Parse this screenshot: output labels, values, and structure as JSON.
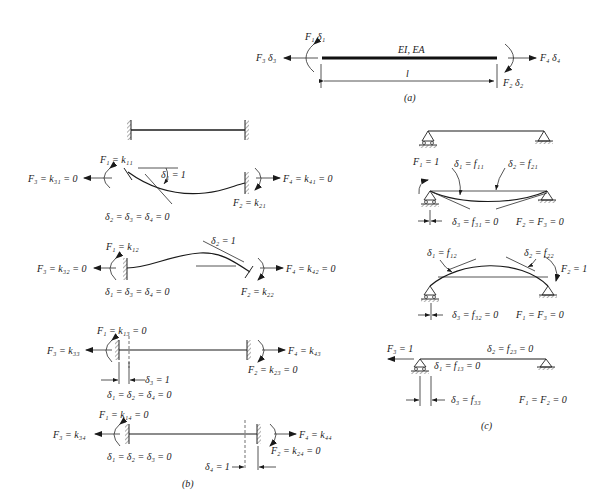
{
  "part_a": {
    "caption": "(a)",
    "beam_props": "EI, EA",
    "length": "l",
    "left_top": "F₁ δ₁",
    "left_side": "F₃ δ₃",
    "right_side": "F₄ δ₄",
    "right_bottom": "F₂ δ₂"
  },
  "part_b": {
    "caption": "(b)",
    "case1": {
      "f1": "F₁ = k₁₁",
      "f3": "F₃ = k₃₁ = 0",
      "f4": "F₄ = k₄₁ = 0",
      "f2": "F₂ = k₂₁",
      "disp": "δ₁ = 1",
      "zeros": "δ₂ = δ₃ = δ₄ = 0"
    },
    "case2": {
      "f1": "F₁ = k₁₂",
      "f3": "F₃ = k₃₂ = 0",
      "f4": "F₄ = k₄₂ = 0",
      "f2": "F₂ = k₂₂",
      "disp": "δ₂ = 1",
      "zeros": "δ₁ = δ₃ = δ₄ = 0"
    },
    "case3": {
      "f1": "F₁ = k₁₃ = 0",
      "f3": "F₃ = k₃₃",
      "f4": "F₄ = k₄₃",
      "f2": "F₂ = k₂₃ = 0",
      "disp": "δ₃ = 1",
      "zeros": "δ₁ = δ₂ = δ₄ = 0"
    },
    "case4": {
      "f1": "F₁ = k₁₄ = 0",
      "f3": "F₃ = k₃₄",
      "f4": "F₄ = k₄₄",
      "f2": "F₂ = k₂₄ = 0",
      "disp": "δ₄ = 1",
      "zeros": "δ₁ = δ₂ = δ₃ = 0"
    }
  },
  "part_c": {
    "caption": "(c)",
    "case1": {
      "load": "F₁ = 1",
      "d1": "δ₁ = f₁₁",
      "d2": "δ₂ = f₂₁",
      "d3": "δ₃ = f₃₁ = 0",
      "zeros": "F₂ = F₃ = 0"
    },
    "case2": {
      "load": "F₂ = 1",
      "d1": "δ₁ = f₁₂",
      "d2": "δ₂ = f₂₂",
      "d3": "δ₃ = f₃₂ = 0",
      "zeros": "F₁ = F₃ = 0"
    },
    "case3": {
      "load": "F₃ = 1",
      "d1": "δ₁ = f₁₃ = 0",
      "d2": "δ₂ = f₂₃ = 0",
      "d3": "δ₃ = f₃₃",
      "zeros": "F₁ = F₂ = 0"
    }
  }
}
